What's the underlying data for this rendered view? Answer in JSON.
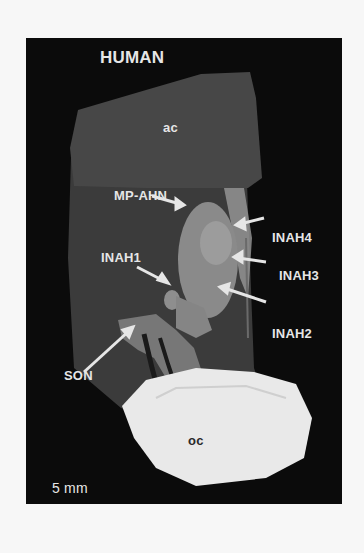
{
  "figure": {
    "title": "HUMAN",
    "labels": {
      "ac": "ac",
      "mp_ahn": "MP-AHN",
      "inah1": "INAH1",
      "inah2": "INAH2",
      "inah3": "INAH3",
      "inah4": "INAH4",
      "son": "SON",
      "oc": "oc"
    },
    "scale_bar": {
      "label": "5 mm"
    },
    "colors": {
      "background": "#0b0b0b",
      "ac_region": "#474747",
      "hypothalamus": "#3d3d3d",
      "mp_ahn": "#8c8c8c",
      "son": "#7a7a7a",
      "oc": "#e9e9e9",
      "label": "#e6e6e6"
    }
  }
}
